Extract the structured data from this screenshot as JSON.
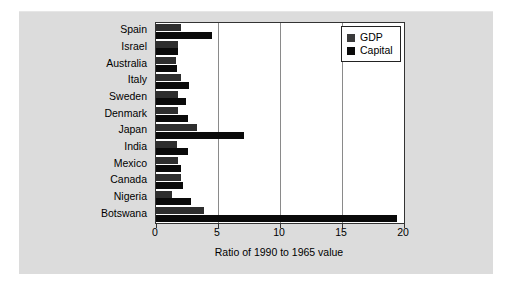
{
  "chart_data": {
    "type": "bar",
    "orientation": "horizontal",
    "title": "",
    "xlabel": "Ratio of 1990 to 1965 value",
    "ylabel": "",
    "xlim": [
      0,
      20
    ],
    "xticks": [
      0,
      5,
      10,
      15,
      20
    ],
    "xtick_labels": [
      "0",
      "5",
      "10",
      "15",
      "20"
    ],
    "grid": true,
    "grid_axis": "x",
    "legend_position": "upper right",
    "categories": [
      "Spain",
      "Israel",
      "Australia",
      "Italy",
      "Sweden",
      "Denmark",
      "Japan",
      "India",
      "Mexico",
      "Canada",
      "Nigeria",
      "Botswana"
    ],
    "series": [
      {
        "name": "GDP",
        "color": "#2e2e2e",
        "values": [
          2.0,
          1.8,
          1.6,
          2.0,
          1.8,
          1.8,
          3.3,
          1.7,
          1.8,
          2.0,
          1.3,
          3.9
        ]
      },
      {
        "name": "Capital",
        "color": "#0a0a0a",
        "values": [
          4.5,
          1.8,
          1.7,
          2.7,
          2.4,
          2.6,
          7.1,
          2.6,
          2.0,
          2.2,
          2.8,
          19.4
        ]
      }
    ]
  },
  "legend": {
    "entries": [
      {
        "label": "GDP",
        "swatch": "gdp"
      },
      {
        "label": "Capital",
        "swatch": "capital"
      }
    ]
  },
  "colors": {
    "figure_background": "#ffffff",
    "panel_background": "#dcdcdc",
    "plot_background": "#ffffff",
    "axis": "#333333",
    "gridline": "#8a8a8a",
    "gdp_bar": "#2e2e2e",
    "capital_bar": "#0a0a0a",
    "text": "#000000"
  }
}
